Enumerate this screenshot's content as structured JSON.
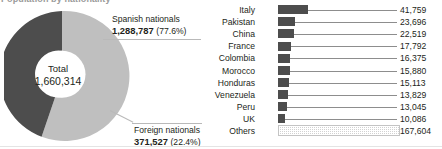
{
  "clipped_header": "Population by nationality",
  "donut": {
    "center_label": "Total",
    "center_value": "1,660,314",
    "segments": [
      {
        "name": "Spanish nationals",
        "value": "1,288,787",
        "percent_label": "(77.6%)",
        "percent": 77.6,
        "color": "#bfbfbf"
      },
      {
        "name": "Foreign nationals",
        "value": "371,527",
        "percent_label": "(22.4%)",
        "percent": 22.4,
        "color": "#4d4d4d"
      }
    ]
  },
  "chart_data": {
    "type": "bar",
    "orientation": "horizontal",
    "title": "",
    "xlabel": "",
    "ylabel": "",
    "grid": false,
    "legend": "none",
    "bar_color": "#4d4d4d",
    "others_fill": "stipple",
    "xlim": [
      0,
      167604
    ],
    "categories": [
      "Italy",
      "Pakistan",
      "China",
      "France",
      "Colombia",
      "Morocco",
      "Honduras",
      "Venezuela",
      "Peru",
      "UK",
      "Others"
    ],
    "values": [
      41759,
      23696,
      22519,
      17792,
      16375,
      15880,
      15113,
      13829,
      13045,
      10086,
      167604
    ],
    "value_labels": [
      "41,759",
      "23,696",
      "22,519",
      "17,792",
      "16,375",
      "15,880",
      "15,113",
      "13,829",
      "13,045",
      "10,086",
      "167,604"
    ]
  }
}
